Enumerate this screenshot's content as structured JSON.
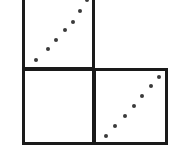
{
  "figure": {
    "type": "scatterplot-matrix-fragment",
    "width": 175,
    "height": 151,
    "background_color": "#ffffff",
    "frame_color": "#1a1a1a",
    "frame_width_px": 3,
    "point_color": "#3a3a3a",
    "point_size_px": 4
  },
  "chart_data": {
    "type": "scatter",
    "title": "",
    "subtitle": "",
    "xlabel": "",
    "ylabel": "",
    "grid": false,
    "legend": null,
    "legend_position": "none",
    "layout": {
      "rows": 2,
      "cols": 2,
      "description": "Two-by-two panel grid; top-left and bottom-right panels contain positively correlated point series, bottom-left panel is empty, top-right cell has no frame."
    },
    "panels": [
      {
        "name": "top-left",
        "row": 0,
        "col": 0,
        "framed": true,
        "top_border_visible": false,
        "xlim": [
          0,
          100
        ],
        "ylim": [
          0,
          100
        ],
        "n_points": 7,
        "relationship": "positive-linear",
        "x": [
          16,
          34,
          47,
          60,
          71,
          82,
          93
        ],
        "y": [
          10,
          25,
          38,
          52,
          64,
          79,
          94
        ]
      },
      {
        "name": "top-right",
        "row": 0,
        "col": 1,
        "framed": false,
        "n_points": 0,
        "x": [],
        "y": []
      },
      {
        "name": "bottom-left",
        "row": 1,
        "col": 0,
        "framed": true,
        "xlim": [
          0,
          100
        ],
        "ylim": [
          0,
          100
        ],
        "n_points": 0,
        "relationship": "none",
        "x": [],
        "y": []
      },
      {
        "name": "bottom-right",
        "row": 1,
        "col": 1,
        "framed": true,
        "xlim": [
          0,
          100
        ],
        "ylim": [
          0,
          100
        ],
        "n_points": 7,
        "relationship": "positive-linear",
        "x": [
          14,
          28,
          42,
          55,
          67,
          80,
          91
        ],
        "y": [
          9,
          22,
          37,
          51,
          65,
          79,
          92
        ]
      }
    ]
  }
}
